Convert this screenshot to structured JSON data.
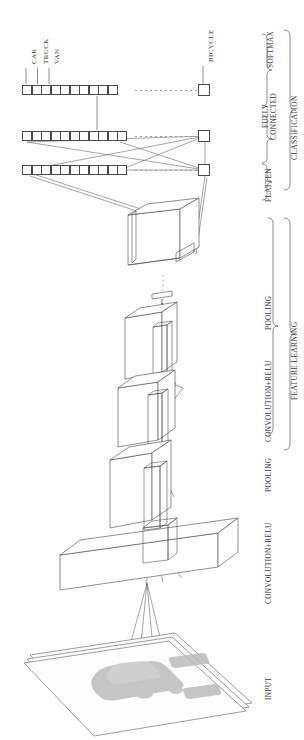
{
  "figure": {
    "orientation": "rotated-90-ccw",
    "background_color": "#ffffff",
    "line_color": "#4a4a4a",
    "blob_color": "#b9b9b9"
  },
  "class_labels": [
    {
      "name": "CAR",
      "index": 0
    },
    {
      "name": "TRUCK",
      "index": 1
    },
    {
      "name": "VAN",
      "index": 2
    },
    {
      "name": "BICYCLE",
      "index": 9
    }
  ],
  "ellipsis_label": "dotted-ellipsis",
  "stage_labels": [
    {
      "key": "input",
      "text": "INPUT"
    },
    {
      "key": "conv1",
      "text": "CONVOLUTION+RELU"
    },
    {
      "key": "pool1",
      "text": "POOLING"
    },
    {
      "key": "conv2",
      "text": "CONVOLUTION+RELU"
    },
    {
      "key": "pool2",
      "text": "POOLING"
    },
    {
      "key": "flatten",
      "text": "FLATTEN"
    },
    {
      "key": "fully_conn",
      "text": "FULLY CONNECTED"
    },
    {
      "key": "softmax",
      "text": "SOFTMAX"
    }
  ],
  "group_labels": [
    {
      "key": "feature_learning",
      "text": "FEATURE LEARNING"
    },
    {
      "key": "classification",
      "text": "CLASSIFICATION"
    }
  ],
  "layers": {
    "softmax_row": {
      "name": "softmax-vector",
      "cells": 10,
      "extra_cell": 1
    },
    "fc_row": {
      "name": "fully-connected-vector",
      "cells": 11,
      "extra_cell": 1
    },
    "flatten_row": {
      "name": "flatten-vector",
      "cells": 11,
      "extra_cell": 1
    }
  },
  "volumes": [
    {
      "name": "flatten-source-cube",
      "kind": "cube"
    },
    {
      "name": "pooling-2-volume",
      "kind": "box"
    },
    {
      "name": "convolution-2-volume",
      "kind": "box"
    },
    {
      "name": "pooling-1-volume",
      "kind": "box"
    },
    {
      "name": "convolution-1-volume",
      "kind": "slab"
    },
    {
      "name": "input-image-planes",
      "kind": "stacked-planes",
      "planes": 3
    }
  ],
  "input_image": {
    "name": "input-photo",
    "content": "blurred car silhouette"
  }
}
